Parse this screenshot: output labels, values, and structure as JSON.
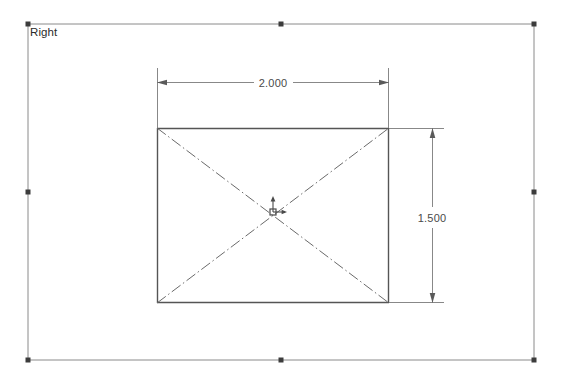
{
  "view": {
    "label": "Right",
    "label_color": "#2b2b2b"
  },
  "sheet": {
    "border_color": "#8a8a8a",
    "handle_color": "#3c3c3c",
    "bounds": {
      "left": 28,
      "top": 24,
      "right": 534,
      "bottom": 360
    },
    "handles": [
      {
        "name": "handle-top-left",
        "x": 28,
        "y": 24
      },
      {
        "name": "handle-top-mid",
        "x": 281,
        "y": 24
      },
      {
        "name": "handle-top-right",
        "x": 534,
        "y": 24
      },
      {
        "name": "handle-mid-left",
        "x": 28,
        "y": 192
      },
      {
        "name": "handle-mid-right",
        "x": 534,
        "y": 192
      },
      {
        "name": "handle-bottom-left",
        "x": 28,
        "y": 360
      },
      {
        "name": "handle-bottom-mid",
        "x": 281,
        "y": 360
      },
      {
        "name": "handle-bottom-right",
        "x": 534,
        "y": 360
      }
    ]
  },
  "sketch": {
    "rectangle": {
      "line_color": "#555555",
      "left": 157,
      "top": 128,
      "right": 389,
      "bottom": 303
    },
    "centerlines": {
      "color": "#666666",
      "pattern": "dash-dot",
      "diagonals": [
        {
          "name": "diagonal-tl-br",
          "x1": 157,
          "y1": 128,
          "x2": 389,
          "y2": 303
        },
        {
          "name": "diagonal-bl-tr",
          "x1": 157,
          "y1": 303,
          "x2": 389,
          "y2": 128
        }
      ]
    },
    "origin": {
      "x": 273,
      "y": 212,
      "color": "#4a4a4a"
    }
  },
  "dimensions": {
    "color": "#6b6b6b",
    "horizontal": {
      "name": "width-dimension",
      "value": "2.000",
      "line_y": 82,
      "x1": 157,
      "x2": 389,
      "text_x": 273,
      "text_y": 86,
      "extension_top": 68,
      "extension_bottom": 128
    },
    "vertical": {
      "name": "height-dimension",
      "value": "1.500",
      "line_x": 432,
      "y1": 128,
      "y2": 303,
      "text_x": 432,
      "text_y": 221,
      "extension_left": 389,
      "extension_right": 444
    }
  }
}
